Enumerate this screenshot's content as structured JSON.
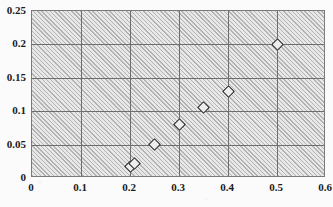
{
  "chart_data": {
    "type": "scatter",
    "title": "",
    "xlabel": "",
    "ylabel": "",
    "xlim": [
      0,
      0.6
    ],
    "ylim": [
      0,
      0.25
    ],
    "grid": true,
    "legend": false,
    "legend_position": "none",
    "marker": "open-diamond",
    "background": "diagonal-hatch",
    "xticks": [
      "0",
      "0.1",
      "0.2",
      "0.3",
      "0.4",
      "0.5",
      "0.6"
    ],
    "xtick_values": [
      0,
      0.1,
      0.2,
      0.3,
      0.4,
      0.5,
      0.6
    ],
    "yticks": [
      "0",
      "0.05",
      "0.1",
      "0.15",
      "0.2",
      "0.25"
    ],
    "ytick_values": [
      0,
      0.05,
      0.1,
      0.15,
      0.2,
      0.25
    ],
    "series": [
      {
        "name": "series-1",
        "points": [
          {
            "x": 0.2,
            "y": 0.017
          },
          {
            "x": 0.21,
            "y": 0.022
          },
          {
            "x": 0.25,
            "y": 0.05
          },
          {
            "x": 0.3,
            "y": 0.08
          },
          {
            "x": 0.35,
            "y": 0.105
          },
          {
            "x": 0.4,
            "y": 0.13
          },
          {
            "x": 0.5,
            "y": 0.2
          }
        ]
      }
    ]
  },
  "colors": {
    "marker_stroke": "#1d1d1d",
    "marker_fill": "#eeeeee",
    "gridline": "#6e6e6e",
    "plot_border": "#7a7a7a",
    "plot_background": "#d9d9d9",
    "hatch_line": "#b2b2b2",
    "tick_label": "#1a1a1a",
    "page_background": "#fbfbfb"
  }
}
